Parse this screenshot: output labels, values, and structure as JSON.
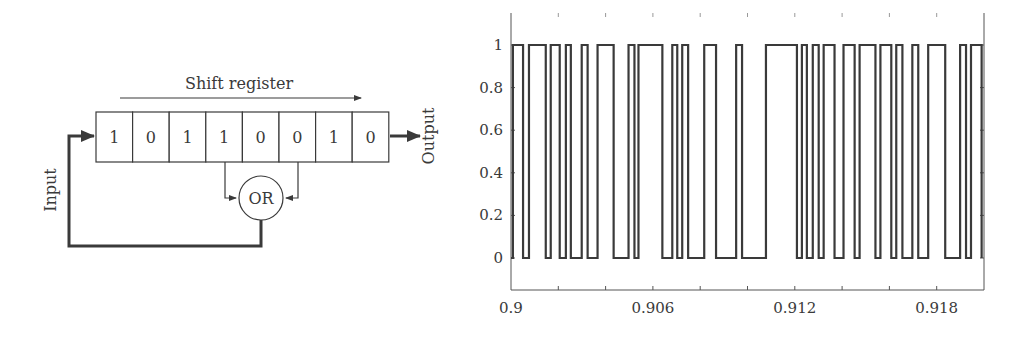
{
  "diagram": {
    "title": "Shift register",
    "input_label": "Input",
    "output_label": "Output",
    "gate_label": "OR",
    "cells": [
      "1",
      "0",
      "1",
      "1",
      "0",
      "0",
      "1",
      "0"
    ],
    "tap_cells": [
      4,
      6
    ],
    "line_color": "#3a3a3a"
  },
  "chart_data": {
    "type": "line",
    "subtype": "step",
    "title": "",
    "xlabel": "",
    "ylabel": "",
    "xlim": [
      0.9,
      0.92
    ],
    "ylim": [
      -0.15,
      1.15
    ],
    "xticks": [
      0.9,
      0.902,
      0.904,
      0.906,
      0.908,
      0.91,
      0.912,
      0.914,
      0.916,
      0.918
    ],
    "xtick_labels": [
      "0.9",
      "",
      "",
      "0.906",
      "",
      "",
      "0.912",
      "",
      "",
      "0.918"
    ],
    "yticks": [
      0,
      0.2,
      0.4,
      0.6,
      0.8,
      1
    ],
    "ytick_labels": [
      "0",
      "0.2",
      "0.4",
      "0.6",
      "0.8",
      "1"
    ],
    "grid": false,
    "legend": null,
    "line_color": "#3a3a3a",
    "series": [
      {
        "name": "Output sequence",
        "high_intervals": [
          [
            0.90008,
            0.90051
          ],
          [
            0.90076,
            0.90147
          ],
          [
            0.90168,
            0.90206
          ],
          [
            0.90232,
            0.90253
          ],
          [
            0.90299,
            0.90324
          ],
          [
            0.90366,
            0.90434
          ],
          [
            0.90497,
            0.90522
          ],
          [
            0.90539,
            0.9064
          ],
          [
            0.90682,
            0.90703
          ],
          [
            0.90724,
            0.90749
          ],
          [
            0.90817,
            0.90867
          ],
          [
            0.90952,
            0.90977
          ],
          [
            0.91078,
            0.91209
          ],
          [
            0.9123,
            0.91251
          ],
          [
            0.91276,
            0.91301
          ],
          [
            0.91322,
            0.91368
          ],
          [
            0.91406,
            0.91453
          ],
          [
            0.91474,
            0.91541
          ],
          [
            0.91562,
            0.91608
          ],
          [
            0.91629,
            0.91655
          ],
          [
            0.91697,
            0.91722
          ],
          [
            0.91764,
            0.91836
          ],
          [
            0.91899,
            0.91924
          ],
          [
            0.91945,
            0.9199
          ]
        ]
      }
    ]
  }
}
